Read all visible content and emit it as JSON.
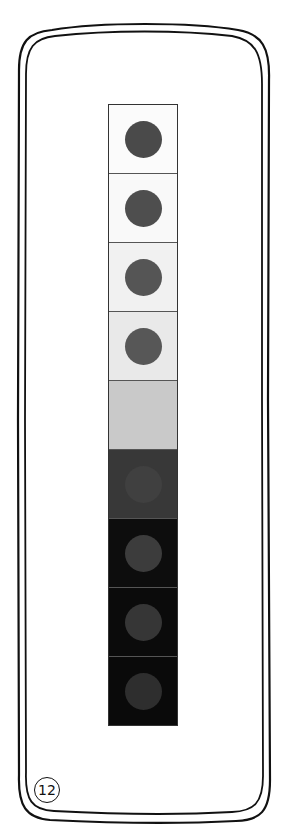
{
  "illustration": {
    "frame": {
      "style": "double hand-drawn rounded rectangle",
      "stroke_color": "#111111"
    },
    "strip": {
      "cells": [
        {
          "background": "#fbfbfb",
          "dot_color": "#4a4a4a",
          "dot_visible": true
        },
        {
          "background": "#f9f9f9",
          "dot_color": "#4e4e4e",
          "dot_visible": true
        },
        {
          "background": "#f1f1f1",
          "dot_color": "#555555",
          "dot_visible": true
        },
        {
          "background": "#e9e9e9",
          "dot_color": "#575757",
          "dot_visible": true
        },
        {
          "background": "#c9c9c9",
          "dot_color": "#c9c9c9",
          "dot_visible": false
        },
        {
          "background": "#383838",
          "dot_color": "#404040",
          "dot_visible": true
        },
        {
          "background": "#0d0d0d",
          "dot_color": "#3c3c3c",
          "dot_visible": true
        },
        {
          "background": "#0b0b0b",
          "dot_color": "#363636",
          "dot_visible": true
        },
        {
          "background": "#0a0a0a",
          "dot_color": "#2e2e2e",
          "dot_visible": true
        }
      ]
    },
    "page_number": "12"
  }
}
